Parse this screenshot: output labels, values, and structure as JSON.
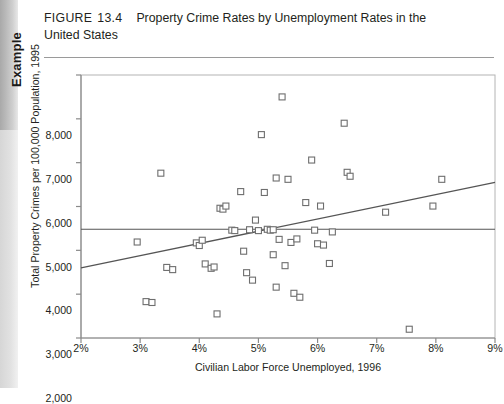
{
  "sidebar": {
    "tab_label": "Example"
  },
  "header": {
    "figure_label": "FIGURE",
    "figure_number": "13.4",
    "title_line1": "Property Crime Rates by Unemployment Rates in the",
    "title_line2": "United States"
  },
  "chart_data": {
    "type": "scatter",
    "title": "Property Crime Rates by Unemployment Rates in the United States",
    "xlabel": "Civilian Labor Force Unemployed, 1996",
    "ylabel": "Total Property Crimes per 100,000 Population, 1995",
    "xlim": [
      2,
      9
    ],
    "ylim": [
      2000,
      8000
    ],
    "xticks": [
      2,
      3,
      4,
      5,
      6,
      7,
      8,
      9
    ],
    "xtick_labels": [
      "2%",
      "3%",
      "4%",
      "5%",
      "6%",
      "7%",
      "8%",
      "9%"
    ],
    "yticks": [
      2000,
      3000,
      4000,
      5000,
      6000,
      7000,
      8000
    ],
    "ytick_labels": [
      "2,000",
      "3,000",
      "4,000",
      "5,000",
      "6,000",
      "7,000",
      "8,000"
    ],
    "grid": false,
    "legend": "none",
    "marker": "open-square",
    "marker_color": "#6e6e6e",
    "line_color": "#555555",
    "points": [
      [
        2.95,
        4190
      ],
      [
        3.1,
        2830
      ],
      [
        3.2,
        2810
      ],
      [
        3.35,
        5760
      ],
      [
        3.45,
        3610
      ],
      [
        3.55,
        3560
      ],
      [
        3.95,
        4170
      ],
      [
        4.0,
        4110
      ],
      [
        4.05,
        4230
      ],
      [
        4.1,
        3690
      ],
      [
        4.2,
        3590
      ],
      [
        4.25,
        3620
      ],
      [
        4.3,
        2550
      ],
      [
        4.35,
        4960
      ],
      [
        4.4,
        4940
      ],
      [
        4.45,
        5010
      ],
      [
        4.55,
        4460
      ],
      [
        4.6,
        4450
      ],
      [
        4.7,
        5340
      ],
      [
        4.75,
        3980
      ],
      [
        4.8,
        3490
      ],
      [
        4.85,
        4470
      ],
      [
        4.9,
        3320
      ],
      [
        4.95,
        4690
      ],
      [
        5.0,
        4450
      ],
      [
        5.05,
        6640
      ],
      [
        5.1,
        5320
      ],
      [
        5.15,
        4480
      ],
      [
        5.2,
        4460
      ],
      [
        5.25,
        4470
      ],
      [
        5.25,
        3900
      ],
      [
        5.3,
        5650
      ],
      [
        5.3,
        3160
      ],
      [
        5.35,
        4250
      ],
      [
        5.4,
        7500
      ],
      [
        5.45,
        3650
      ],
      [
        5.5,
        5620
      ],
      [
        5.55,
        4180
      ],
      [
        5.6,
        3020
      ],
      [
        5.65,
        4260
      ],
      [
        5.7,
        2930
      ],
      [
        5.8,
        5090
      ],
      [
        5.9,
        6060
      ],
      [
        5.95,
        4460
      ],
      [
        6.0,
        4150
      ],
      [
        6.05,
        5010
      ],
      [
        6.1,
        4120
      ],
      [
        6.2,
        3700
      ],
      [
        6.25,
        4420
      ],
      [
        6.45,
        6900
      ],
      [
        6.5,
        5780
      ],
      [
        6.55,
        5690
      ],
      [
        7.15,
        4870
      ],
      [
        7.55,
        2200
      ],
      [
        7.95,
        5010
      ],
      [
        8.1,
        5620
      ]
    ],
    "regression_line": {
      "x": [
        2,
        9
      ],
      "y": [
        3600,
        5550
      ],
      "label": "regression-line"
    },
    "mean_line": {
      "y": 4480,
      "label": "mean-line"
    }
  }
}
